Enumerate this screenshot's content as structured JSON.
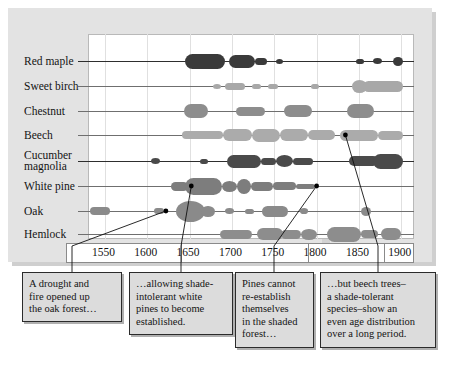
{
  "chart_data": {
    "type": "area",
    "title": "",
    "xlabel": "",
    "ylabel": "",
    "xlim": [
      1530,
      1915
    ],
    "grid": true,
    "legend": "none",
    "tick_labels": [
      "1550",
      "1600",
      "1650",
      "1700",
      "1750",
      "1800",
      "1850",
      "1900"
    ],
    "tick_values": [
      1550,
      1600,
      1650,
      1700,
      1750,
      1800,
      1850,
      1900
    ],
    "categories": [
      "Red maple",
      "Sweet birch",
      "Chestnut",
      "Beech",
      "Cucumber magnolia",
      "White pine",
      "Oak",
      "Hemlock"
    ],
    "series": [
      {
        "name": "Red maple",
        "color": "#3a3a3a",
        "blobs": [
          {
            "start": 1645,
            "end": 1692,
            "thickness": 15
          },
          {
            "start": 1697,
            "end": 1727,
            "thickness": 13
          },
          {
            "start": 1727,
            "end": 1742,
            "thickness": 7
          },
          {
            "start": 1752,
            "end": 1760,
            "thickness": 5
          },
          {
            "start": 1846,
            "end": 1856,
            "thickness": 5
          },
          {
            "start": 1866,
            "end": 1877,
            "thickness": 6
          },
          {
            "start": 1890,
            "end": 1902,
            "thickness": 9
          }
        ]
      },
      {
        "name": "Sweet birch",
        "color": "#a8a8a8",
        "blobs": [
          {
            "start": 1678,
            "end": 1687,
            "thickness": 5
          },
          {
            "start": 1692,
            "end": 1716,
            "thickness": 7
          },
          {
            "start": 1724,
            "end": 1734,
            "thickness": 5
          },
          {
            "start": 1742,
            "end": 1754,
            "thickness": 5
          },
          {
            "start": 1793,
            "end": 1803,
            "thickness": 5
          },
          {
            "start": 1842,
            "end": 1860,
            "thickness": 13
          },
          {
            "start": 1855,
            "end": 1902,
            "thickness": 11
          }
        ]
      },
      {
        "name": "Chestnut",
        "color": "#8d8d8d",
        "blobs": [
          {
            "start": 1643,
            "end": 1672,
            "thickness": 14
          },
          {
            "start": 1705,
            "end": 1739,
            "thickness": 9
          },
          {
            "start": 1762,
            "end": 1794,
            "thickness": 12
          },
          {
            "start": 1836,
            "end": 1868,
            "thickness": 14
          }
        ]
      },
      {
        "name": "Beech",
        "color": "#ababab",
        "blobs": [
          {
            "start": 1641,
            "end": 1690,
            "thickness": 8
          },
          {
            "start": 1690,
            "end": 1724,
            "thickness": 12
          },
          {
            "start": 1724,
            "end": 1757,
            "thickness": 13
          },
          {
            "start": 1757,
            "end": 1790,
            "thickness": 12
          },
          {
            "start": 1790,
            "end": 1822,
            "thickness": 10
          },
          {
            "start": 1828,
            "end": 1872,
            "thickness": 11
          },
          {
            "start": 1872,
            "end": 1902,
            "thickness": 9
          }
        ]
      },
      {
        "name": "Cucumber magnolia",
        "color": "#4a4a4a",
        "blobs": [
          {
            "start": 1604,
            "end": 1615,
            "thickness": 6
          },
          {
            "start": 1662,
            "end": 1672,
            "thickness": 5
          },
          {
            "start": 1694,
            "end": 1734,
            "thickness": 13
          },
          {
            "start": 1734,
            "end": 1752,
            "thickness": 7
          },
          {
            "start": 1752,
            "end": 1772,
            "thickness": 12
          },
          {
            "start": 1772,
            "end": 1796,
            "thickness": 7
          },
          {
            "start": 1838,
            "end": 1872,
            "thickness": 10
          },
          {
            "start": 1866,
            "end": 1902,
            "thickness": 15
          }
        ]
      },
      {
        "name": "White pine",
        "color": "#7d7d7d",
        "blobs": [
          {
            "start": 1628,
            "end": 1648,
            "thickness": 9
          },
          {
            "start": 1645,
            "end": 1688,
            "thickness": 17
          },
          {
            "start": 1688,
            "end": 1706,
            "thickness": 11
          },
          {
            "start": 1706,
            "end": 1722,
            "thickness": 15
          },
          {
            "start": 1722,
            "end": 1748,
            "thickness": 9
          },
          {
            "start": 1748,
            "end": 1776,
            "thickness": 8
          },
          {
            "start": 1776,
            "end": 1798,
            "thickness": 5
          }
        ]
      },
      {
        "name": "Oak",
        "color": "#8a8a8a",
        "blobs": [
          {
            "start": 1532,
            "end": 1556,
            "thickness": 8
          },
          {
            "start": 1608,
            "end": 1620,
            "thickness": 6
          },
          {
            "start": 1634,
            "end": 1668,
            "thickness": 21
          },
          {
            "start": 1664,
            "end": 1680,
            "thickness": 11
          },
          {
            "start": 1692,
            "end": 1702,
            "thickness": 6
          },
          {
            "start": 1716,
            "end": 1726,
            "thickness": 5
          },
          {
            "start": 1736,
            "end": 1766,
            "thickness": 11
          },
          {
            "start": 1780,
            "end": 1790,
            "thickness": 6
          },
          {
            "start": 1852,
            "end": 1864,
            "thickness": 9
          }
        ]
      },
      {
        "name": "Hemlock",
        "color": "#8d8d8d",
        "blobs": [
          {
            "start": 1686,
            "end": 1724,
            "thickness": 9
          },
          {
            "start": 1730,
            "end": 1760,
            "thickness": 12
          },
          {
            "start": 1758,
            "end": 1782,
            "thickness": 9
          },
          {
            "start": 1782,
            "end": 1800,
            "thickness": 11
          },
          {
            "start": 1812,
            "end": 1852,
            "thickness": 15
          },
          {
            "start": 1852,
            "end": 1872,
            "thickness": 8
          },
          {
            "start": 1876,
            "end": 1900,
            "thickness": 12
          }
        ]
      }
    ],
    "annotations": [
      {
        "text": "A drought and fire opened up the oak forest…",
        "target_series": "Oak",
        "target_year": 1622
      },
      {
        "text": "…allowing shade-intolerant white pines to become established.",
        "target_series": "White pine",
        "target_year": 1652
      },
      {
        "text": "Pines cannot re-establish themselves in the shaded forest…",
        "target_series": "White pine",
        "target_year": 1800
      },
      {
        "text": "…but beech trees–a shade-tolerant species–show an even age distribution over a long period.",
        "target_series": "Beech",
        "target_year": 1834
      }
    ]
  },
  "axis": {
    "ticks": [
      "1550",
      "1600",
      "1650",
      "1700",
      "1750",
      "1800",
      "1850",
      "1900"
    ]
  },
  "species": [
    {
      "label": "Red maple"
    },
    {
      "label": "Sweet birch"
    },
    {
      "label": "Chestnut"
    },
    {
      "label": "Beech"
    },
    {
      "label": "Cucumber"
    },
    {
      "label": "magnolia"
    },
    {
      "label": "White pine"
    },
    {
      "label": "Oak"
    },
    {
      "label": "Hemlock"
    }
  ],
  "callouts": [
    {
      "id": "callout-drought",
      "lines": [
        "A drought and",
        "fire opened up",
        "the oak forest…"
      ]
    },
    {
      "id": "callout-white-pine",
      "lines": [
        "…allowing shade-",
        "intolerant white",
        "pines to become",
        "established."
      ]
    },
    {
      "id": "callout-pines-cannot",
      "lines": [
        "Pines cannot",
        "re-establish",
        "themselves",
        "in the shaded",
        "forest…"
      ]
    },
    {
      "id": "callout-beech",
      "lines": [
        "…but beech trees–",
        "a shade-tolerant",
        "species–show an",
        "even age distribution",
        "over a long period."
      ]
    }
  ],
  "colors": {
    "panel": "#e3e3e3",
    "plot_background": "#ffffff",
    "callout_background": "#dcdcdc",
    "dark_blob": "#3a3a3a",
    "mid_blob": "#8a8a8a",
    "light_blob": "#ababab"
  }
}
